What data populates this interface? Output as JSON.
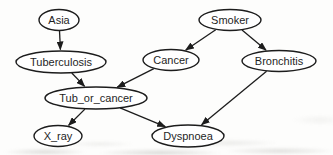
{
  "figure": {
    "colors": {
      "background": "#fdfdfc",
      "node_fill": "#ffffff",
      "node_stroke": "#1c1c1c",
      "edge_stroke": "#1c1c1c",
      "label_text": "#1f1f1f"
    },
    "nodes": [
      {
        "id": "asia",
        "label": "Asia",
        "cx": 59,
        "cy": 20,
        "rx": 20,
        "ry": 10.5
      },
      {
        "id": "smoker",
        "label": "Smoker",
        "cx": 230,
        "cy": 20,
        "rx": 31,
        "ry": 10.5
      },
      {
        "id": "tuberculosis",
        "label": "Tuberculosis",
        "cx": 61,
        "cy": 62,
        "rx": 45,
        "ry": 11
      },
      {
        "id": "cancer",
        "label": "Cancer",
        "cx": 171,
        "cy": 60,
        "rx": 28,
        "ry": 10.5
      },
      {
        "id": "bronchitis",
        "label": "Bronchitis",
        "cx": 279,
        "cy": 61,
        "rx": 37,
        "ry": 10.5
      },
      {
        "id": "tub_or_cancer",
        "label": "Tub_or_cancer",
        "cx": 96,
        "cy": 98,
        "rx": 51,
        "ry": 11
      },
      {
        "id": "x_ray",
        "label": "X_ray",
        "cx": 58,
        "cy": 136,
        "rx": 24,
        "ry": 10.5
      },
      {
        "id": "dyspnoea",
        "label": "Dyspnoea",
        "cx": 188,
        "cy": 136,
        "rx": 36,
        "ry": 11
      }
    ],
    "edges": [
      {
        "from": "asia",
        "to": "tuberculosis"
      },
      {
        "from": "smoker",
        "to": "cancer"
      },
      {
        "from": "smoker",
        "to": "bronchitis"
      },
      {
        "from": "tuberculosis",
        "to": "tub_or_cancer"
      },
      {
        "from": "cancer",
        "to": "tub_or_cancer"
      },
      {
        "from": "tub_or_cancer",
        "to": "x_ray"
      },
      {
        "from": "tub_or_cancer",
        "to": "dyspnoea"
      },
      {
        "from": "bronchitis",
        "to": "dyspnoea"
      }
    ]
  }
}
